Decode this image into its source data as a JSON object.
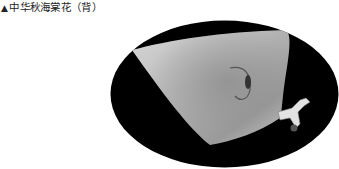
{
  "caption": {
    "marker": "▲",
    "text": "中华秋海棠花（背）"
  },
  "figure": {
    "shape": "ellipse",
    "background_color": "#000000",
    "petal_color": "#bdbdbd",
    "stem_color": "#e6e6e6"
  }
}
